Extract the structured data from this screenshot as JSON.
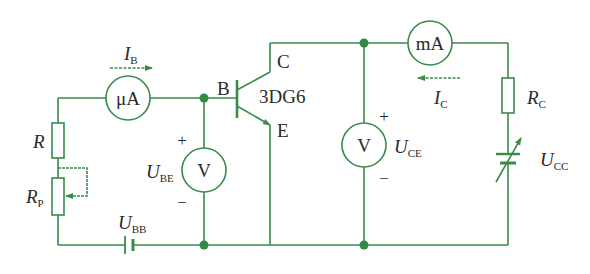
{
  "diagram": {
    "type": "transistor common-emitter characteristic test circuit",
    "colors": {
      "wire": "#3a8a4a",
      "node": "#2e8a45",
      "text": "#2a2a2a",
      "background": "#ffffff"
    },
    "transistor": {
      "model": "3DG6",
      "base_label": "B",
      "collector_label": "C",
      "emitter_label": "E"
    },
    "meters": {
      "base_ammeter": {
        "symbol": "μA"
      },
      "collector_ammeter": {
        "symbol": "mA"
      },
      "ube_voltmeter": {
        "symbol": "V",
        "label_main": "U",
        "label_sub": "BE",
        "plus": "+",
        "minus": "−"
      },
      "uce_voltmeter": {
        "symbol": "V",
        "label_main": "U",
        "label_sub": "CE",
        "plus": "+",
        "minus": "−"
      }
    },
    "currents": {
      "ib": {
        "main": "I",
        "sub": "B"
      },
      "ic": {
        "main": "I",
        "sub": "C"
      }
    },
    "resistors": {
      "r": {
        "main": "R"
      },
      "rp": {
        "main": "R",
        "sub": "P"
      },
      "rc": {
        "main": "R",
        "sub": "C"
      }
    },
    "sources": {
      "ubb": {
        "main": "U",
        "sub": "BB"
      },
      "ucc": {
        "main": "U",
        "sub": "CC"
      }
    }
  }
}
